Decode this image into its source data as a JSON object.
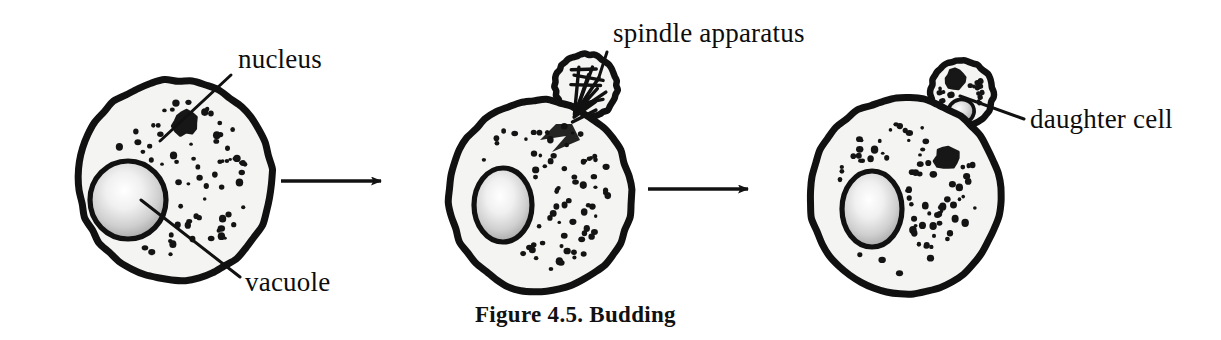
{
  "figure": {
    "caption": "Figure 4.5. Budding",
    "caption_x": 475,
    "caption_y": 322,
    "background_color": "#ffffff",
    "ink_color": "#0d0d0d"
  },
  "colors": {
    "outline": "#111111",
    "cytoplasm_fill": "#f4f4f2",
    "granule": "#141414",
    "nucleus_fill": "#171717",
    "vacuole_center": "#ffffff",
    "vacuole_edge": "#9a9a9a",
    "arrow": "#121212"
  },
  "labels": [
    {
      "id": "nucleus",
      "text": "nucleus",
      "x": 238,
      "y": 68,
      "anchor": "start",
      "leader": {
        "x1": 231,
        "y1": 75,
        "x2": 160,
        "y2": 141
      }
    },
    {
      "id": "vacuole",
      "text": "vacuole",
      "x": 245,
      "y": 291,
      "anchor": "start",
      "leader": {
        "x1": 240,
        "y1": 277,
        "x2": 141,
        "y2": 200
      }
    },
    {
      "id": "spindle-apparatus",
      "text": "spindle apparatus",
      "x": 613,
      "y": 42,
      "anchor": "start",
      "leader": {
        "x1": 607,
        "y1": 52,
        "x2": 598,
        "y2": 80
      }
    },
    {
      "id": "daughter-cell",
      "text": "daughter cell",
      "x": 1030,
      "y": 128,
      "anchor": "start",
      "leader": {
        "x1": 1024,
        "y1": 119,
        "x2": 960,
        "y2": 96
      }
    }
  ],
  "arrows": [
    {
      "id": "arrow-stage-1-to-2",
      "x1": 281,
      "y1": 181,
      "x2": 392,
      "y2": 181
    },
    {
      "id": "arrow-stage-2-to-3",
      "x1": 648,
      "y1": 189,
      "x2": 759,
      "y2": 189
    }
  ],
  "cells": [
    {
      "id": "cell-stage-1",
      "stage_label": "mother cell before budding",
      "cx": 175,
      "cy": 180,
      "rx": 97,
      "ry": 100,
      "rotation": -6,
      "nucleus": {
        "cx": 185,
        "cy": 123,
        "r": 11
      },
      "vacuole": {
        "cx": 128,
        "cy": 200,
        "rx": 38,
        "ry": 39
      },
      "bud": null,
      "granule_seed": 11,
      "granule_count": 68
    },
    {
      "id": "cell-stage-2",
      "stage_label": "mother cell with spindle apparatus in bud",
      "cx": 540,
      "cy": 196,
      "rx": 91,
      "ry": 96,
      "rotation": -4,
      "nucleus": null,
      "vacuole": {
        "cx": 503,
        "cy": 205,
        "rx": 29,
        "ry": 37
      },
      "bud": {
        "type": "spindle",
        "cx": 586,
        "cy": 86,
        "rx": 31,
        "ry": 32,
        "rotation": -18
      },
      "granule_seed": 29,
      "granule_count": 72
    },
    {
      "id": "cell-stage-3",
      "stage_label": "mother cell with formed daughter cell",
      "cx": 905,
      "cy": 196,
      "rx": 95,
      "ry": 98,
      "rotation": -5,
      "nucleus": {
        "cx": 947,
        "cy": 158,
        "r": 11
      },
      "vacuole": {
        "cx": 872,
        "cy": 209,
        "rx": 30,
        "ry": 38
      },
      "bud": {
        "type": "daughter",
        "cx": 962,
        "cy": 93,
        "rx": 31,
        "ry": 33,
        "rotation": -10,
        "nucleus": {
          "cx": 958,
          "cy": 78,
          "r": 9
        },
        "vacuole": {
          "cx": 958,
          "cy": 111,
          "rx": 13,
          "ry": 12
        },
        "granule_seed": 71,
        "granule_count": 17
      },
      "granule_seed": 47,
      "granule_count": 74
    }
  ],
  "spindle_fibers": [
    {
      "x1": 568,
      "y1": 108,
      "x2": 598,
      "y2": 70
    },
    {
      "x1": 568,
      "y1": 108,
      "x2": 592,
      "y2": 76
    },
    {
      "x1": 568,
      "y1": 108,
      "x2": 601,
      "y2": 82
    },
    {
      "x1": 568,
      "y1": 108,
      "x2": 596,
      "y2": 92
    },
    {
      "x1": 568,
      "y1": 108,
      "x2": 603,
      "y2": 98
    },
    {
      "x1": 565,
      "y1": 112,
      "x2": 590,
      "y2": 104
    },
    {
      "x1": 566,
      "y1": 110,
      "x2": 585,
      "y2": 66
    },
    {
      "x1": 577,
      "y1": 66,
      "x2": 601,
      "y2": 73
    },
    {
      "x1": 578,
      "y1": 72,
      "x2": 604,
      "y2": 86
    },
    {
      "x1": 572,
      "y1": 80,
      "x2": 600,
      "y2": 90
    },
    {
      "x1": 564,
      "y1": 100,
      "x2": 598,
      "y2": 104
    },
    {
      "x1": 562,
      "y1": 116,
      "x2": 588,
      "y2": 112
    }
  ]
}
